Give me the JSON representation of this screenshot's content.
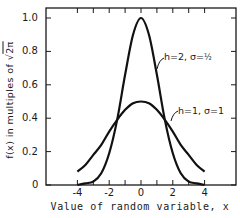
{
  "chart_data": {
    "type": "line",
    "title": "",
    "xlabel": "Value of random variable, x",
    "ylabel": "f(x) in multiples of √2π",
    "xlim": [
      -6,
      6
    ],
    "ylim": [
      0,
      1.06
    ],
    "x_ticks": [
      -4,
      -2,
      0,
      2,
      4
    ],
    "x_tick_labels": [
      "-4",
      "-2",
      "0",
      "2",
      "4"
    ],
    "x_minor_ticks": [
      -4,
      -3,
      -2,
      -1,
      0,
      1,
      2,
      3,
      4
    ],
    "y_ticks": [
      0,
      0.2,
      0.4,
      0.6,
      0.8,
      1.0
    ],
    "y_tick_labels": [
      "0",
      "0.2",
      "0.4",
      "0.6",
      "0.8",
      "1.0"
    ],
    "grid": false,
    "legend": "inline annotations",
    "x": [
      -4,
      -3.5,
      -3,
      -2.5,
      -2,
      -1.5,
      -1,
      -0.5,
      0,
      0.5,
      1,
      1.5,
      2,
      2.5,
      3,
      3.5,
      4
    ],
    "series": [
      {
        "name": "h=2, σ=½",
        "values": [
          0.0,
          0.01,
          0.02,
          0.07,
          0.19,
          0.39,
          0.66,
          0.9,
          1.0,
          0.9,
          0.66,
          0.39,
          0.19,
          0.07,
          0.02,
          0.01,
          0.0
        ]
      },
      {
        "name": "h=1, σ=1",
        "values": [
          0.08,
          0.12,
          0.18,
          0.24,
          0.32,
          0.39,
          0.45,
          0.49,
          0.5,
          0.49,
          0.45,
          0.39,
          0.32,
          0.24,
          0.18,
          0.12,
          0.08
        ]
      }
    ],
    "annotations": [
      {
        "text": "h=2, σ=½",
        "target_series": 0
      },
      {
        "text": "h=1, σ=1",
        "target_series": 1
      }
    ]
  },
  "labels": {
    "ylabel_prefix": "f(x) in multiples of",
    "ylabel_sqrt": "2π",
    "xlabel": "Value of random variable, x",
    "ann_tall_h": "h=2, σ=",
    "ann_tall_frac": "½",
    "ann_wide": "h=1, σ=1"
  }
}
